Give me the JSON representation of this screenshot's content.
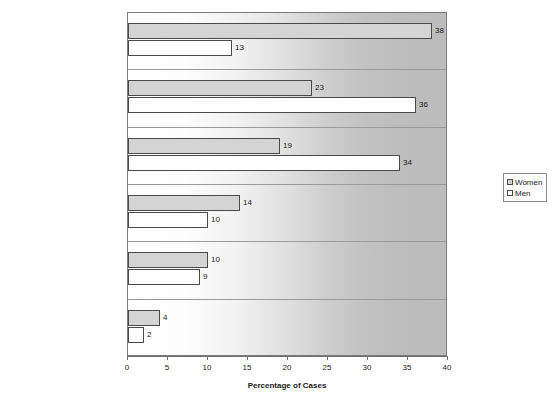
{
  "chart_data": {
    "type": "bar",
    "orientation": "horizontal",
    "title": "",
    "xlabel": "Percentage of Cases",
    "ylabel": "",
    "xlim": [
      0,
      40
    ],
    "xticks": [
      0,
      5,
      10,
      15,
      20,
      25,
      30,
      35,
      40
    ],
    "grid": false,
    "legend_position": "right",
    "categories": [
      "Spouse/ex-spouse",
      "Stranger",
      "Acquaintance",
      "Date/former date",
      "Cohabiting partner/ex-partner",
      "Relative other than spouse"
    ],
    "series": [
      {
        "name": "Women",
        "color": "#d4d4d4",
        "values": [
          38,
          23,
          19,
          14,
          10,
          4
        ]
      },
      {
        "name": "Men",
        "color": "#ffffff",
        "values": [
          13,
          36,
          34,
          10,
          9,
          2
        ]
      }
    ]
  },
  "legend": {
    "items": [
      {
        "label": "Women",
        "swatch": "women"
      },
      {
        "label": "Men",
        "swatch": "men"
      }
    ]
  },
  "axis": {
    "x_title": "Percentage of Cases",
    "tick_labels": [
      "0",
      "5",
      "10",
      "15",
      "20",
      "25",
      "30",
      "35",
      "40"
    ]
  }
}
